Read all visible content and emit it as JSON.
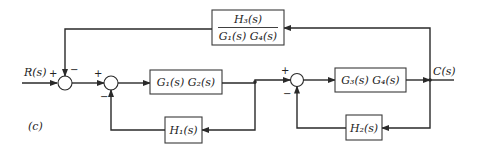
{
  "diagram": {
    "type": "block-diagram",
    "caption": "(c)",
    "input": {
      "label": "R(s)"
    },
    "output": {
      "label": "C(s)"
    },
    "blocks": {
      "g1g2": {
        "label": "G₁(s) G₂(s)"
      },
      "g3g4": {
        "label": "G₃(s) G₄(s)"
      },
      "h1": {
        "label": "H₁(s)"
      },
      "h2": {
        "label": "H₂(s)"
      },
      "h3": {
        "numerator": "H₃(s)",
        "denominator": "G₁(s) G₄(s)"
      }
    },
    "summing_junctions": [
      {
        "id": "sj1",
        "signs": {
          "left": "+",
          "top": "−"
        }
      },
      {
        "id": "sj2",
        "signs": {
          "left": "+",
          "bottom": "−"
        }
      },
      {
        "id": "sj3",
        "signs": {
          "left": "+",
          "bottom": "−"
        }
      }
    ],
    "colors": {
      "line": "#2a2a2a",
      "background": "#ffffff"
    }
  }
}
